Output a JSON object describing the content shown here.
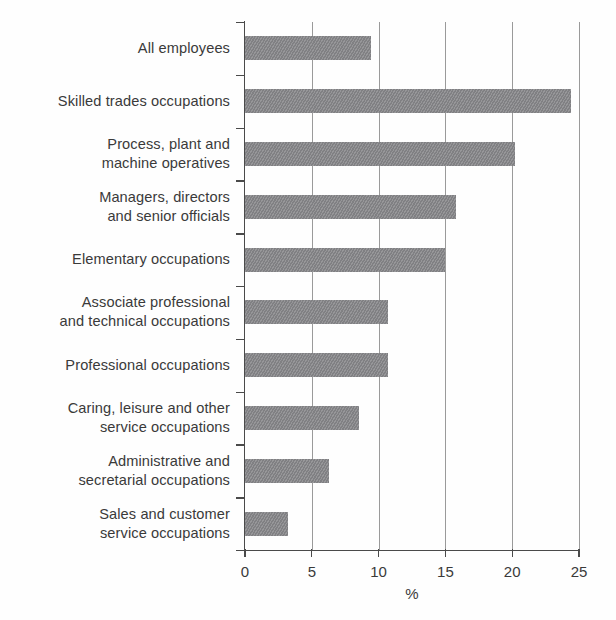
{
  "chart_data": {
    "type": "bar",
    "orientation": "horizontal",
    "title": "",
    "subtitle": "",
    "xlabel": "%",
    "ylabel": "",
    "xlim": [
      0,
      25
    ],
    "xticks": [
      0,
      5,
      10,
      15,
      20,
      25
    ],
    "xtick_labels": [
      "0",
      "5",
      "10",
      "15",
      "20",
      "25"
    ],
    "grid": "vertical",
    "legend": "none",
    "bar_color": "#87878a",
    "categories": [
      "All employees",
      "Skilled trades occupations",
      "Process, plant and\nmachine operatives",
      "Managers, directors\nand senior officials",
      "Elementary occupations",
      "Associate professional\nand technical occupations",
      "Professional occupations",
      "Caring, leisure and other\nservice occupations",
      "Administrative and\nsecretarial occupations",
      "Sales and customer\nservice occupations"
    ],
    "values": [
      9.4,
      24.4,
      20.2,
      15.8,
      15.0,
      10.7,
      10.7,
      8.5,
      6.3,
      3.2
    ]
  },
  "axis": {
    "x_title": "%",
    "tick_labels": [
      "0",
      "5",
      "10",
      "15",
      "20",
      "25"
    ]
  }
}
